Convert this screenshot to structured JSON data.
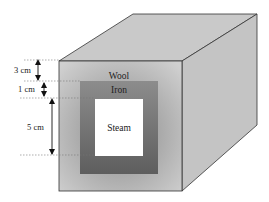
{
  "diagram": {
    "layers": {
      "outer": "Wool",
      "middle": "Iron",
      "inner": "Steam"
    },
    "dimensions": [
      {
        "label": "3 cm",
        "describes": "Wool thickness"
      },
      {
        "label": "1 cm",
        "describes": "Iron thickness"
      },
      {
        "label": "5 cm",
        "describes": "Steam channel width"
      }
    ],
    "colors": {
      "wool_face": "#b8b8b8",
      "iron": "#6e6e6e",
      "steam": "#ffffff",
      "box_side": "#c4c4c4",
      "box_top": "#c9c9c9",
      "edge": "#333333"
    }
  }
}
